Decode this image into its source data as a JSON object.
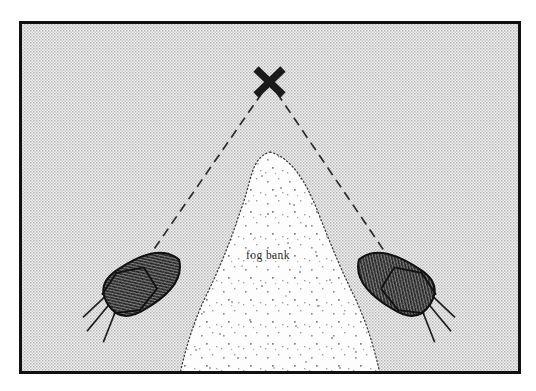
{
  "figure": {
    "kind": "line-drawing-illustration",
    "canvas": {
      "width": 536,
      "height": 391,
      "background": "#ffffff"
    },
    "frame": {
      "name": "illustration-border",
      "x": 19,
      "y": 21,
      "width": 502,
      "height": 353,
      "stroke": "#111111",
      "stroke_width": 3,
      "fill_pattern": "halftone-checker-gray",
      "fill_tone": "#d7d7d7"
    },
    "target": {
      "label": "X",
      "marker": "x-cross",
      "center_x": 269,
      "center_y": 82,
      "arm_half_length": 15,
      "stroke": "#1a1a1a",
      "stroke_width": 7
    },
    "sight_lines": [
      {
        "name": "left-sight-line",
        "from_x": 262,
        "from_y": 93,
        "to_x": 152,
        "to_y": 253,
        "dash": "9 6",
        "stroke": "#2a2a2a",
        "stroke_width": 1.6
      },
      {
        "name": "right-sight-line",
        "from_x": 277,
        "from_y": 93,
        "to_x": 385,
        "to_y": 253,
        "dash": "9 6",
        "stroke": "#2a2a2a",
        "stroke_width": 1.6
      }
    ],
    "fog_bank": {
      "label": "fog bank",
      "label_x": 268,
      "label_y": 259,
      "fill": "#fdfdfd",
      "outline": "dotted",
      "outline_stroke": "#3a3a3a",
      "apex_x": 270,
      "apex_y": 152,
      "base_y": 374,
      "left_base_x": 180,
      "right_base_x": 382,
      "speckle_count": 150
    },
    "ships": [
      {
        "name": "left-ship",
        "center_x": 140,
        "center_y": 284,
        "rotation_deg": -32,
        "hull_length": 92,
        "hull_width": 46,
        "fill_pattern": "crosshatch-dark-gray",
        "fill_tone": "#595959",
        "stroke": "#111111",
        "mast_count": 3
      },
      {
        "name": "right-ship",
        "center_x": 398,
        "center_y": 284,
        "rotation_deg": 32,
        "hull_length": 92,
        "hull_width": 46,
        "fill_pattern": "crosshatch-dark-gray",
        "fill_tone": "#595959",
        "stroke": "#111111",
        "mast_count": 3
      }
    ],
    "colors": {
      "ink": "#111111",
      "background_gray": "#d7d7d7",
      "ship_gray": "#595959",
      "fog_white": "#fdfdfd"
    }
  }
}
